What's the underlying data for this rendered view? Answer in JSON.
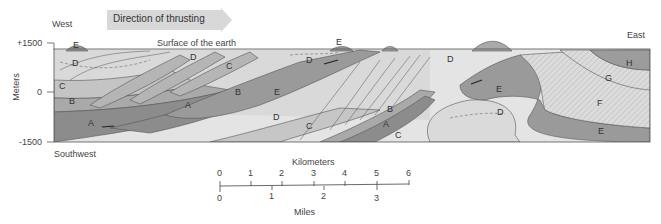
{
  "figure": {
    "direction_banner": "Direction of thrusting",
    "west_label": "West",
    "east_label": "East",
    "southwest_label": "Southwest",
    "surface_label": "Surface of the earth",
    "y_axis": {
      "label": "Meters",
      "ticks": [
        "+1500",
        "0",
        "-1500"
      ]
    },
    "units": {
      "A": "A",
      "B": "B",
      "C": "C",
      "D": "D",
      "E": "E",
      "F": "F",
      "G": "G",
      "H": "H"
    },
    "colors": {
      "A": "#8c8c8c",
      "B": "#a9a9a9",
      "C": "#bfbfbf",
      "D": "#d9d9d9",
      "E": "#9a9a9a",
      "F": "#d0d0d0",
      "G": "#dadada",
      "H": "#9c9c9c",
      "basement": "#e4e4e4",
      "line": "#555555"
    },
    "scale_bar": {
      "km_title": "Kilometers",
      "km_ticks": [
        "0",
        "1",
        "2",
        "3",
        "4",
        "5",
        "6"
      ],
      "mi_title": "Miles",
      "mi_ticks": [
        "0",
        "1",
        "2",
        "3"
      ]
    }
  }
}
